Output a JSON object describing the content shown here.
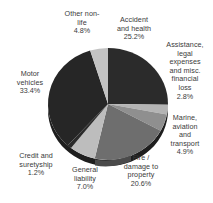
{
  "chart_data": {
    "type": "pie",
    "title": "",
    "subtitle": "",
    "xlabel": "",
    "ylabel": "",
    "legend_position": "none",
    "labels_position": "around-perimeter",
    "grid": false,
    "start_angle_deg": 0,
    "direction": "clockwise",
    "categories": [
      "Accident and health",
      "Assistance, legal expenses and misc. financial loss",
      "Marine, aviation and transport",
      "Fire / damage to property",
      "General liability",
      "Credit and suretyship",
      "Motor vehicles",
      "Other non-life"
    ],
    "values": [
      25.2,
      2.8,
      4.9,
      20.6,
      7.0,
      1.2,
      33.4,
      4.8
    ],
    "value_suffix": "%",
    "colors": [
      "#2b2b2b",
      "#b4b4b4",
      "#8f8f8f",
      "#6e6e6e",
      "#bdbdbd",
      "#2b2b2b",
      "#262626",
      "#c2c2c2"
    ],
    "slices": [
      {
        "name": "Accident and health",
        "value": 25.2,
        "display_value": "25.2%",
        "color": "#2b2b2b"
      },
      {
        "name": "Assistance, legal expenses and misc. financial loss",
        "value": 2.8,
        "display_value": "2.8%",
        "color": "#b4b4b4"
      },
      {
        "name": "Marine, aviation and transport",
        "value": 4.9,
        "display_value": "4.9%",
        "color": "#8f8f8f"
      },
      {
        "name": "Fire / damage to property",
        "value": 20.6,
        "display_value": "20.6%",
        "color": "#6e6e6e"
      },
      {
        "name": "General liability",
        "value": 7.0,
        "display_value": "7.0%",
        "color": "#bdbdbd"
      },
      {
        "name": "Credit and suretyship",
        "value": 1.2,
        "display_value": "1.2%",
        "color": "#2b2b2b"
      },
      {
        "name": "Motor vehicles",
        "value": 33.4,
        "display_value": "33.4%",
        "color": "#262626"
      },
      {
        "name": "Other non-life",
        "value": 4.8,
        "display_value": "4.8%",
        "color": "#c2c2c2"
      }
    ]
  },
  "labels": {
    "other_nonlife": {
      "line1": "Other non-",
      "line2": "life",
      "value": "4.8%"
    },
    "accident_health": {
      "line1": "Accident",
      "line2": "and health",
      "value": "25.2%"
    },
    "assistance": {
      "line1": "Assistance,",
      "line2": "legal",
      "line3": "expenses",
      "line4": "and misc.",
      "line5": "financial",
      "line6": "loss",
      "value": "2.8%"
    },
    "marine": {
      "line1": "Marine,",
      "line2": "aviation",
      "line3": "and",
      "line4": "transport",
      "value": "4.9%"
    },
    "fire_property": {
      "line1": "Fire /",
      "line2": "damage to",
      "line3": "property",
      "value": "20.6%"
    },
    "general_liability": {
      "line1": "General",
      "line2": "liability",
      "value": "7.0%"
    },
    "credit_suretyship": {
      "line1": "Credit and",
      "line2": "suretyship",
      "value": "1.2%"
    },
    "motor_vehicles": {
      "line1": "Motor",
      "line2": "vehicles",
      "value": "33.4%"
    }
  },
  "style": {
    "background": "#ffffff",
    "text_color": "#3a3a3a"
  }
}
